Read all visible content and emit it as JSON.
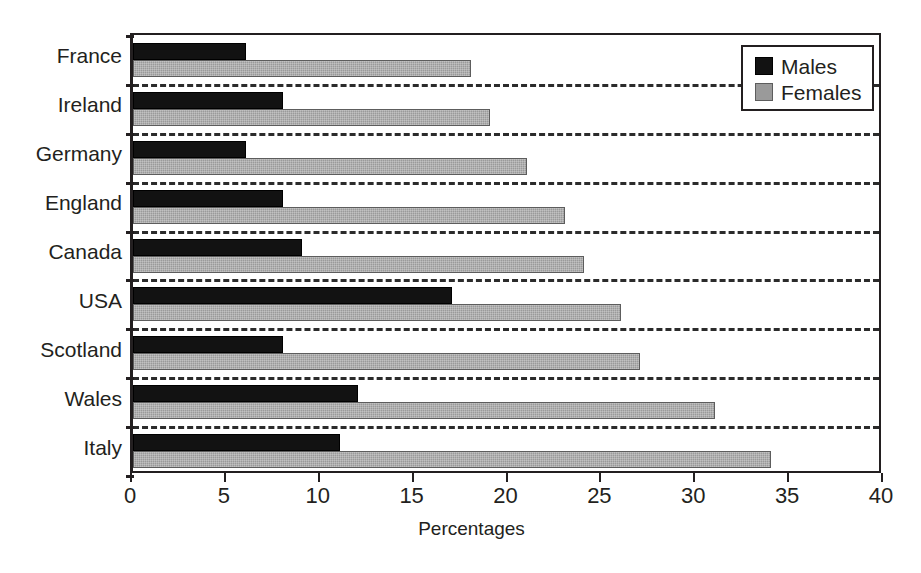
{
  "chart_data": {
    "type": "bar",
    "orientation": "horizontal",
    "title": "",
    "xlabel": "Percentages",
    "ylabel": "",
    "xlim": [
      0,
      40
    ],
    "xticks": [
      0,
      5,
      10,
      15,
      20,
      25,
      30,
      35,
      40
    ],
    "xtick_labels": [
      "0",
      "5",
      "10",
      "15",
      "20",
      "25",
      "30",
      "35",
      "40"
    ],
    "grid": "dashed-horizontal-separators",
    "legend_position": "top-right",
    "categories": [
      "France",
      "Ireland",
      "Germany",
      "England",
      "Canada",
      "USA",
      "Scotland",
      "Wales",
      "Italy"
    ],
    "series": [
      {
        "name": "Males",
        "color": "#121212",
        "values": [
          6,
          8,
          6,
          8,
          9,
          17,
          8,
          12,
          11
        ]
      },
      {
        "name": "Females",
        "color": "#9a9a9a",
        "values": [
          18,
          19,
          21,
          23,
          24,
          26,
          27,
          31,
          34
        ]
      }
    ]
  },
  "axis": {
    "x_title": "Percentages"
  },
  "legend": {
    "items": [
      {
        "label": "Males",
        "swatch": "males-swatch"
      },
      {
        "label": "Females",
        "swatch": "females-swatch"
      }
    ]
  }
}
